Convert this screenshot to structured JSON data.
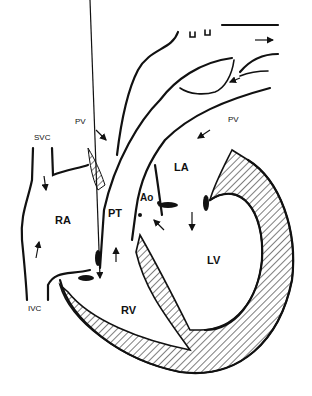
{
  "diagram": {
    "type": "heart-anatomy-schematic",
    "labels": {
      "svc": "SVC",
      "ivc": "IVC",
      "pv_left": "PV",
      "pv_right": "PV",
      "ra": "RA",
      "rv": "RV",
      "la": "LA",
      "lv": "LV",
      "pt": "PT",
      "ao": "Ao"
    },
    "colors": {
      "ink": "#111111",
      "background": "#ffffff"
    }
  }
}
